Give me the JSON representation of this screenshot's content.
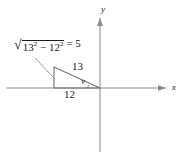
{
  "figure": {
    "kind": "right-triangle-on-coordinate-axes",
    "axes": {
      "x_label": "x",
      "y_label": "y"
    },
    "triangle": {
      "hypotenuse_label": "13",
      "base_label": "12",
      "angle_label": "v",
      "height_expression": {
        "radical_sign": "√",
        "radicand_base1": "13",
        "radicand_exp1": "2",
        "operator": "−",
        "radicand_base2": "12",
        "radicand_exp2": "2",
        "equals": "= 5"
      }
    },
    "colors": {
      "stroke": "#6f6f6f",
      "axis": "#8a8a8a",
      "text": "#1a1a1a"
    }
  }
}
